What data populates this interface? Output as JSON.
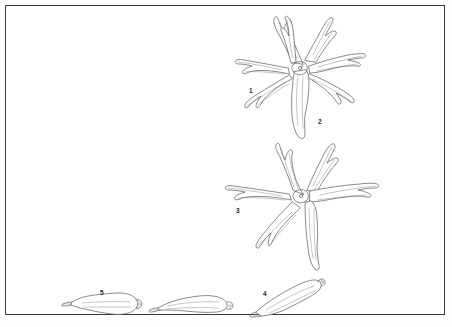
{
  "figure": {
    "caption": "",
    "background_color": "#fdfdfd",
    "frame_color": "#3a3a3d",
    "ink_color": "#4a4a50",
    "view": "line drawing plate"
  },
  "labels": [
    {
      "id": "1",
      "text": "1",
      "x": 249,
      "y": 88,
      "refers_to": "whole-starfish-upper"
    },
    {
      "id": "2",
      "text": "2",
      "x": 318,
      "y": 119,
      "refers_to": "arm-of-upper-starfish"
    },
    {
      "id": "3",
      "text": "3",
      "x": 236,
      "y": 208,
      "refers_to": "whole-starfish-lower"
    },
    {
      "id": "4",
      "text": "4",
      "x": 263,
      "y": 291,
      "refers_to": "detached-arm-right"
    },
    {
      "id": "5",
      "text": "5",
      "x": 100,
      "y": 290,
      "refers_to": "detached-arm-left"
    }
  ],
  "specimens": [
    {
      "name": "starfish-upper",
      "label": "1",
      "arm_count": 7,
      "center_x": 300,
      "center_y": 66
    },
    {
      "name": "starfish-lower",
      "label": "3",
      "arm_count": 6,
      "center_x": 301,
      "center_y": 196
    },
    {
      "name": "detached-arm-left",
      "label": "5",
      "center_x": 110,
      "center_y": 303
    },
    {
      "name": "detached-arm-middle",
      "label": "",
      "center_x": 200,
      "center_y": 304
    },
    {
      "name": "detached-arm-right",
      "label": "4",
      "center_x": 290,
      "center_y": 295
    }
  ]
}
